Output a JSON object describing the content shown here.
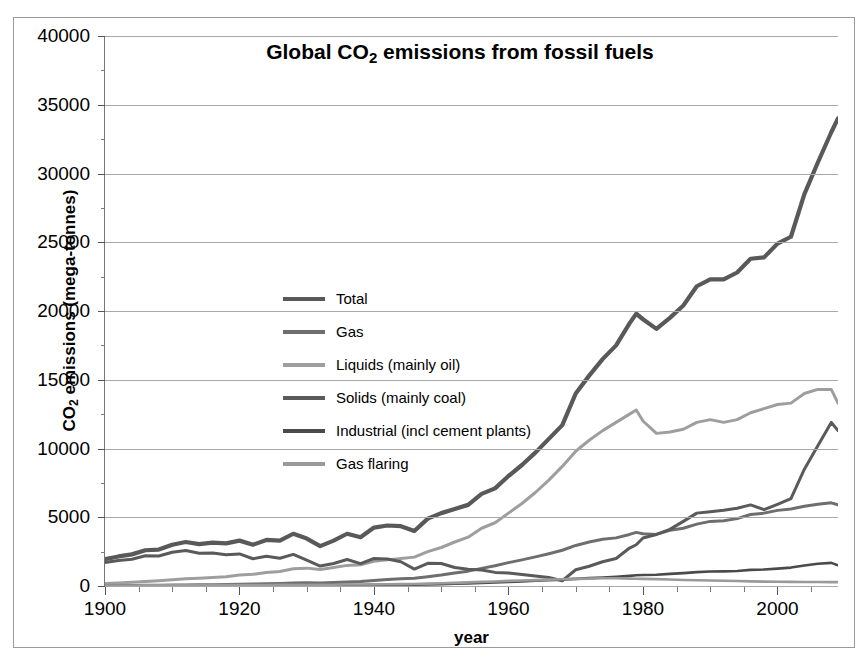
{
  "chart_data": {
    "type": "line",
    "title": "Global  CO2 emissions from fossil fuels",
    "title_main": "Global  CO",
    "title_sub": "2",
    "title_rest": " emissions from fossil fuels",
    "xlabel": "year",
    "ylabel": "CO2 emissions (mega-tonnes)",
    "ylabel_main": "CO",
    "ylabel_sub": "2",
    "ylabel_rest": " emissions (mega-tonnes)",
    "xlim": [
      1900,
      2009
    ],
    "ylim": [
      0,
      40000
    ],
    "ytick_labels": [
      "40000",
      "35000",
      "30000",
      "25000",
      "20000",
      "15000",
      "10000",
      "5000",
      "0"
    ],
    "ytick_values": [
      40000,
      35000,
      30000,
      25000,
      20000,
      15000,
      10000,
      5000,
      0
    ],
    "xtick_labels": [
      "1900",
      "1920",
      "1940",
      "1960",
      "1980",
      "2000"
    ],
    "xtick_values": [
      1900,
      1920,
      1940,
      1960,
      1980,
      2000
    ],
    "xtick_minor_values": [
      1910,
      1930,
      1950,
      1970,
      1990,
      2010
    ],
    "grid": "horizontal",
    "legend_position": "inside-upper-left",
    "x": [
      1900,
      1902,
      1904,
      1906,
      1908,
      1910,
      1912,
      1914,
      1916,
      1918,
      1920,
      1922,
      1924,
      1926,
      1928,
      1930,
      1932,
      1934,
      1936,
      1938,
      1940,
      1942,
      1944,
      1946,
      1948,
      1950,
      1952,
      1954,
      1956,
      1958,
      1960,
      1962,
      1964,
      1966,
      1968,
      1970,
      1972,
      1974,
      1976,
      1978,
      1979,
      1980,
      1982,
      1984,
      1986,
      1988,
      1990,
      1992,
      1994,
      1996,
      1998,
      2000,
      2002,
      2004,
      2006,
      2008,
      2009
    ],
    "series": [
      {
        "name": "Total",
        "color": "#595959",
        "values": [
          1950,
          2150,
          2300,
          2600,
          2650,
          3000,
          3200,
          3050,
          3150,
          3100,
          3300,
          3000,
          3350,
          3300,
          3800,
          3450,
          2900,
          3300,
          3800,
          3550,
          4250,
          4400,
          4350,
          4000,
          4900,
          5300,
          5600,
          5900,
          6700,
          7100,
          8000,
          8800,
          9700,
          10700,
          11700,
          14000,
          15300,
          16500,
          17500,
          19100,
          19800,
          19400,
          18700,
          19500,
          20400,
          21800,
          22300,
          22300,
          22800,
          23800,
          23900,
          24900,
          25400,
          28500,
          30800,
          33000,
          34000
        ]
      },
      {
        "name": "Gas",
        "color": "#6e6e6e",
        "values": [
          20,
          30,
          40,
          50,
          60,
          70,
          80,
          85,
          95,
          110,
          130,
          140,
          160,
          180,
          210,
          230,
          210,
          250,
          300,
          330,
          400,
          470,
          530,
          570,
          680,
          800,
          950,
          1080,
          1280,
          1470,
          1700,
          1900,
          2120,
          2350,
          2600,
          2950,
          3200,
          3400,
          3500,
          3750,
          3900,
          3800,
          3750,
          4050,
          4200,
          4500,
          4700,
          4750,
          4900,
          5200,
          5300,
          5500,
          5600,
          5800,
          5950,
          6050,
          5900
        ]
      },
      {
        "name": "Liquids (mainly oil)",
        "color": "#9e9e9e",
        "values": [
          180,
          220,
          280,
          330,
          380,
          450,
          520,
          560,
          620,
          680,
          800,
          850,
          980,
          1050,
          1250,
          1300,
          1200,
          1350,
          1500,
          1550,
          1800,
          1900,
          2000,
          2100,
          2500,
          2800,
          3200,
          3550,
          4200,
          4600,
          5300,
          6000,
          6800,
          7700,
          8700,
          9800,
          10600,
          11300,
          11900,
          12500,
          12800,
          12000,
          11100,
          11200,
          11400,
          11900,
          12100,
          11900,
          12100,
          12600,
          12900,
          13200,
          13300,
          14000,
          14300,
          14300,
          13300
        ]
      },
      {
        "name": "Solids (mainly coal)",
        "color": "#5a5a5a",
        "values": [
          1700,
          1850,
          1950,
          2200,
          2180,
          2450,
          2580,
          2380,
          2400,
          2280,
          2330,
          1980,
          2170,
          2020,
          2300,
          1880,
          1450,
          1640,
          1930,
          1630,
          2000,
          1970,
          1760,
          1230,
          1650,
          1640,
          1350,
          1220,
          1170,
          990,
          950,
          840,
          730,
          620,
          380,
          1180,
          1440,
          1760,
          2000,
          2760,
          3000,
          3490,
          3750,
          4120,
          4700,
          5300,
          5400,
          5510,
          5650,
          5900,
          5550,
          5940,
          6350,
          8500,
          10200,
          11900,
          11300
        ]
      },
      {
        "name": "Industrial (incl cement plants)",
        "color": "#4a4a4a",
        "values": [
          10,
          12,
          15,
          18,
          20,
          25,
          28,
          30,
          33,
          36,
          40,
          42,
          48,
          52,
          60,
          62,
          55,
          62,
          72,
          78,
          85,
          90,
          95,
          100,
          120,
          140,
          165,
          190,
          230,
          260,
          300,
          340,
          380,
          420,
          460,
          520,
          570,
          620,
          670,
          740,
          780,
          800,
          820,
          880,
          940,
          1010,
          1050,
          1060,
          1090,
          1170,
          1200,
          1260,
          1340,
          1490,
          1620,
          1680,
          1500
        ]
      },
      {
        "name": "Gas flaring",
        "color": "#9a9a9a",
        "values": [
          30,
          35,
          40,
          45,
          50,
          55,
          60,
          62,
          65,
          68,
          70,
          72,
          78,
          82,
          90,
          95,
          85,
          95,
          105,
          110,
          120,
          130,
          140,
          150,
          175,
          200,
          230,
          260,
          300,
          330,
          370,
          400,
          430,
          460,
          490,
          520,
          540,
          560,
          560,
          540,
          530,
          520,
          500,
          470,
          440,
          420,
          400,
          380,
          360,
          340,
          320,
          310,
          300,
          295,
          290,
          285,
          280
        ]
      }
    ]
  },
  "legend": {
    "items": [
      {
        "label": "Total",
        "color": "#595959"
      },
      {
        "label": "Gas",
        "color": "#6e6e6e"
      },
      {
        "label": "Liquids (mainly oil)",
        "color": "#9e9e9e"
      },
      {
        "label": "Solids (mainly coal)",
        "color": "#5a5a5a"
      },
      {
        "label": "Industrial (incl cement plants)",
        "color": "#4a4a4a"
      },
      {
        "label": "Gas flaring",
        "color": "#9a9a9a"
      }
    ]
  }
}
